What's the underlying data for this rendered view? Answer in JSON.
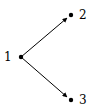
{
  "diagram": {
    "type": "tree",
    "nodes": [
      {
        "id": "1",
        "label": "1",
        "x": 21,
        "y": 57
      },
      {
        "id": "2",
        "label": "2",
        "x": 71,
        "y": 15
      },
      {
        "id": "3",
        "label": "3",
        "x": 71,
        "y": 100
      }
    ],
    "edges": [
      {
        "from": "1",
        "to": "2"
      },
      {
        "from": "1",
        "to": "3"
      }
    ],
    "colors": {
      "stroke": "#000000",
      "background": "#ffffff"
    }
  }
}
